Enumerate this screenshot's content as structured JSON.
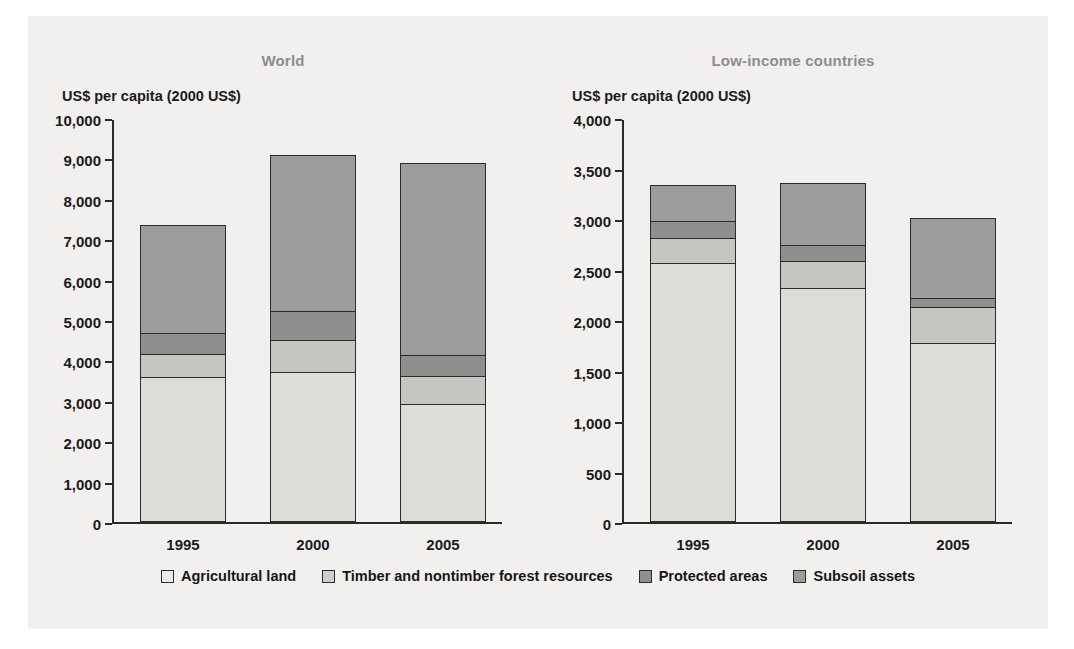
{
  "figure": {
    "background": "#f1f0ee",
    "page_background": "#ffffff"
  },
  "legend": {
    "position": "bottom-center",
    "items": [
      {
        "label": "Agricultural land",
        "color": "#eceae6",
        "key": "agricultural_land"
      },
      {
        "label": "Timber and nontimber forest resources",
        "color": "#cfcecb",
        "key": "timber_and_nontimber_forest_resources"
      },
      {
        "label": "Protected areas",
        "color": "#8f8f8d",
        "key": "protected_areas"
      },
      {
        "label": "Subsoil assets",
        "color": "#9d9d9b",
        "key": "subsoil_assets"
      }
    ]
  },
  "chart_data": [
    {
      "type": "bar",
      "stacked": true,
      "title": "World",
      "xlabel": "",
      "ylabel": "US$ per capita (2000 US$)",
      "categories": [
        "1995",
        "2000",
        "2005"
      ],
      "ylim": [
        0,
        10000
      ],
      "yticks": [
        0,
        1000,
        2000,
        3000,
        4000,
        5000,
        6000,
        7000,
        8000,
        9000,
        10000
      ],
      "ytick_labels": [
        "0",
        "1,000",
        "2,000",
        "3,000",
        "4,000",
        "5,000",
        "6,000",
        "7,000",
        "8,000",
        "9,000",
        "10,000"
      ],
      "grid": false,
      "series": [
        {
          "name": "Agricultural land",
          "color": "#dedcd8",
          "values": [
            3600,
            3720,
            2920
          ]
        },
        {
          "name": "Timber and nontimber forest resources",
          "color": "#c6c5c1",
          "values": [
            600,
            830,
            720
          ]
        },
        {
          "name": "Protected areas",
          "color": "#8f8f8d",
          "values": [
            550,
            730,
            560
          ]
        },
        {
          "name": "Subsoil assets",
          "color": "#9d9d9b",
          "values": [
            2700,
            3900,
            4800
          ]
        }
      ],
      "totals": [
        7450,
        9180,
        9000
      ]
    },
    {
      "type": "bar",
      "stacked": true,
      "title": "Low-income countries",
      "xlabel": "",
      "ylabel": "US$ per capita (2000 US$)",
      "categories": [
        "1995",
        "2000",
        "2005"
      ],
      "ylim": [
        0,
        4000
      ],
      "yticks": [
        0,
        500,
        1000,
        1500,
        2000,
        2500,
        3000,
        3500,
        4000
      ],
      "ytick_labels": [
        "0",
        "500",
        "1,000",
        "1,500",
        "2,000",
        "2,500",
        "3,000",
        "3,500",
        "4,000"
      ],
      "grid": false,
      "series": [
        {
          "name": "Agricultural land",
          "color": "#dedcd8",
          "values": [
            2560,
            2320,
            1770
          ]
        },
        {
          "name": "Timber and nontimber forest resources",
          "color": "#c6c5c1",
          "values": [
            270,
            280,
            370
          ]
        },
        {
          "name": "Protected areas",
          "color": "#8f8f8d",
          "values": [
            180,
            170,
            110
          ]
        },
        {
          "name": "Subsoil assets",
          "color": "#9d9d9b",
          "values": [
            370,
            630,
            800
          ]
        }
      ],
      "totals": [
        3380,
        3400,
        3050
      ]
    }
  ]
}
